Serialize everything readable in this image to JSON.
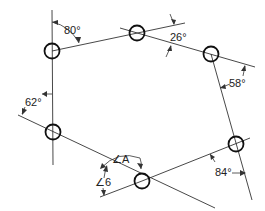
{
  "diagram": {
    "type": "traverse-polygon",
    "stations": [
      {
        "id": "1",
        "x": 52,
        "y": 51
      },
      {
        "id": "2",
        "x": 137,
        "y": 33
      },
      {
        "id": "3",
        "x": 211,
        "y": 54
      },
      {
        "id": "6",
        "x": 236,
        "y": 144
      },
      {
        "id": "5",
        "x": 142,
        "y": 181
      },
      {
        "id": "4",
        "x": 53,
        "y": 132
      }
    ],
    "labels": {
      "a80": "80°",
      "a26": "26°",
      "a58": "58°",
      "a84": "84°",
      "a62": "62°",
      "angleA": "∠A",
      "angle6": "∠6"
    }
  }
}
